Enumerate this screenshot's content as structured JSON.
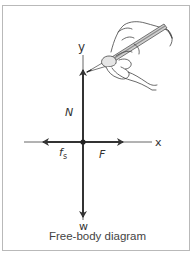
{
  "diagram": {
    "caption": "Free-body diagram",
    "axes": {
      "x_label": "x",
      "y_label": "y"
    },
    "forces": [
      {
        "id": "normal",
        "label": "N",
        "direction": "up"
      },
      {
        "id": "weight",
        "label": "w",
        "direction": "down"
      },
      {
        "id": "applied",
        "label": "F",
        "direction": "right"
      },
      {
        "id": "static-friction",
        "label": "f",
        "subscript": "s",
        "direction": "left"
      }
    ],
    "illustration": "hand-holding-pencil",
    "colors": {
      "ink": "#333333",
      "axis": "#555555",
      "frame": "#b9b9b9",
      "pencil": "#9a9a9a"
    }
  }
}
